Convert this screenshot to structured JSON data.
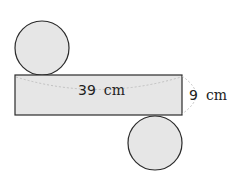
{
  "figure": {
    "top_circle": {
      "cx": 42,
      "cy": 48,
      "r": 27
    },
    "bottom_circle": {
      "cx": 155,
      "cy": 143,
      "r": 27
    },
    "rectangle": {
      "x": 15,
      "y": 75,
      "width": 167,
      "height": 40
    },
    "length_label": {
      "number": "39",
      "unit": "cm"
    },
    "height_label": {
      "number": "9",
      "unit": "cm"
    },
    "colors": {
      "fill": "#e6e6e6",
      "stroke": "#2a2a2a",
      "dashed": "#b8b8b8",
      "text": "#222222"
    }
  }
}
